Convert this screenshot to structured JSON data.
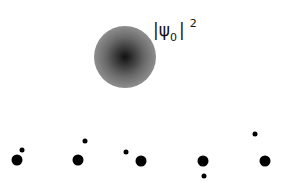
{
  "diagram": {
    "wavefunction": {
      "center": [
        125,
        57
      ],
      "radius": 31,
      "label": {
        "bar_left": "|",
        "psi": "ψ",
        "subscript": "0",
        "bar_right": "|",
        "superscript": "2"
      },
      "colors": {
        "core": "#111111",
        "mid": "#6a6a6a",
        "edge": "#b0b0b0"
      }
    },
    "large_dots": [
      {
        "x": 17,
        "y": 160,
        "d": 11
      },
      {
        "x": 78,
        "y": 160,
        "d": 11
      },
      {
        "x": 141,
        "y": 161,
        "d": 11
      },
      {
        "x": 203,
        "y": 161,
        "d": 11
      },
      {
        "x": 265,
        "y": 161,
        "d": 11
      }
    ],
    "small_dots": [
      {
        "x": 22,
        "y": 150,
        "d": 5
      },
      {
        "x": 85,
        "y": 141,
        "d": 5
      },
      {
        "x": 126,
        "y": 152,
        "d": 5
      },
      {
        "x": 204,
        "y": 176,
        "d": 5
      },
      {
        "x": 255,
        "y": 134,
        "d": 5
      }
    ]
  }
}
